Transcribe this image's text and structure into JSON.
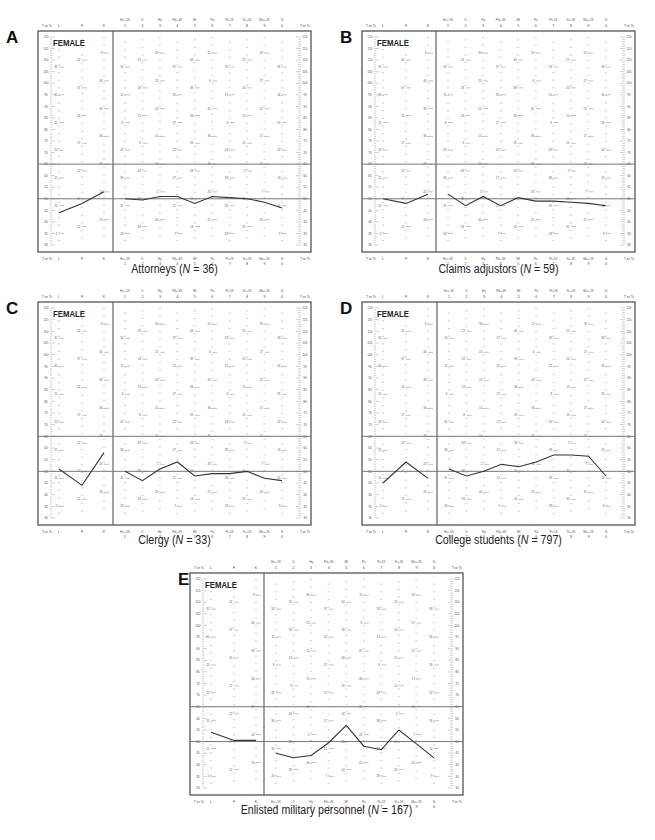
{
  "figure": {
    "y_axis_label": "T or Tc",
    "y_ticks": [
      120,
      115,
      110,
      105,
      100,
      95,
      90,
      85,
      80,
      75,
      70,
      65,
      60,
      55,
      50,
      45,
      40,
      35,
      30
    ],
    "reference_lines": [
      65,
      50
    ],
    "validity_scales": [
      "L",
      "F",
      "K"
    ],
    "clinical_scales": [
      {
        "top": "Hs+.5K",
        "num": "1"
      },
      {
        "top": "D",
        "num": "2"
      },
      {
        "top": "Hy",
        "num": "3"
      },
      {
        "top": "Pd+.4K",
        "num": "4"
      },
      {
        "top": "Mf",
        "num": "5"
      },
      {
        "top": "Pa",
        "num": "6"
      },
      {
        "top": "Pt+1K",
        "num": "7"
      },
      {
        "top": "Sc+1K",
        "num": "8"
      },
      {
        "top": "Ma+.2K",
        "num": "9"
      },
      {
        "top": "Si",
        "num": "0"
      }
    ],
    "gender_label": "FEMALE"
  },
  "panels": [
    {
      "letter": "A",
      "group": "Attorneys",
      "n_label": "N",
      "n_eq": " = 36",
      "n": 36
    },
    {
      "letter": "B",
      "group": "Claims adjustors",
      "n_label": "N",
      "n_eq": " = 59",
      "n": 59
    },
    {
      "letter": "C",
      "group": "Clergy",
      "n_label": "N",
      "n_eq": " = 33",
      "n": 33
    },
    {
      "letter": "D",
      "group": "College students",
      "n_label": "N",
      "n_eq": " = 797",
      "n": 797
    },
    {
      "letter": "E",
      "group": "Enlisted military personnel",
      "n_label": "N",
      "n_eq": " = 167",
      "n": 167
    }
  ],
  "chart_data": [
    {
      "type": "line",
      "title": "Attorneys (N = 36)",
      "subtitle": "FEMALE",
      "xlabel": "",
      "ylabel": "T or Tc",
      "ylim": [
        30,
        120
      ],
      "grid": false,
      "reference_lines": [
        65,
        50
      ],
      "categories": [
        "L",
        "F",
        "K",
        "1 Hs+.5K",
        "2 D",
        "3 Hy",
        "4 Pd+.4K",
        "5 Mf",
        "6 Pa",
        "7 Pt+1K",
        "8 Sc+1K",
        "9 Ma+.2K",
        "0 Si"
      ],
      "series": [
        {
          "name": "Validity",
          "categories": [
            "L",
            "F",
            "K"
          ],
          "values": [
            44,
            48,
            53
          ]
        },
        {
          "name": "Clinical",
          "categories": [
            "1",
            "2",
            "3",
            "4",
            "5",
            "6",
            "7",
            "8",
            "9",
            "0"
          ],
          "values": [
            50,
            49.5,
            51,
            51,
            48,
            51,
            50.5,
            50,
            48.5,
            46
          ]
        }
      ]
    },
    {
      "type": "line",
      "title": "Claims adjustors (N = 59)",
      "subtitle": "FEMALE",
      "xlabel": "",
      "ylabel": "T or Tc",
      "ylim": [
        30,
        120
      ],
      "grid": false,
      "reference_lines": [
        65,
        50
      ],
      "categories": [
        "L",
        "F",
        "K",
        "1 Hs+.5K",
        "2 D",
        "3 Hy",
        "4 Pd+.4K",
        "5 Mf",
        "6 Pa",
        "7 Pt+1K",
        "8 Sc+1K",
        "9 Ma+.2K",
        "0 Si"
      ],
      "series": [
        {
          "name": "Validity",
          "categories": [
            "L",
            "F",
            "K"
          ],
          "values": [
            50,
            48,
            52
          ]
        },
        {
          "name": "Clinical",
          "categories": [
            "1",
            "2",
            "3",
            "4",
            "5",
            "6",
            "7",
            "8",
            "9",
            "0"
          ],
          "values": [
            52,
            47,
            51,
            47,
            50.5,
            49,
            49,
            48.5,
            48,
            47
          ]
        }
      ]
    },
    {
      "type": "line",
      "title": "Clergy (N = 33)",
      "subtitle": "FEMALE",
      "xlabel": "",
      "ylabel": "T or Tc",
      "ylim": [
        30,
        120
      ],
      "grid": false,
      "reference_lines": [
        65,
        50
      ],
      "categories": [
        "L",
        "F",
        "K",
        "1 Hs+.5K",
        "2 D",
        "3 Hy",
        "4 Pd+.4K",
        "5 Mf",
        "6 Pa",
        "7 Pt+1K",
        "8 Sc+1K",
        "9 Ma+.2K",
        "0 Si"
      ],
      "series": [
        {
          "name": "Validity",
          "categories": [
            "L",
            "F",
            "K"
          ],
          "values": [
            51,
            44,
            58
          ]
        },
        {
          "name": "Clinical",
          "categories": [
            "1",
            "2",
            "3",
            "4",
            "5",
            "6",
            "7",
            "8",
            "9",
            "0"
          ],
          "values": [
            50,
            46,
            51,
            54,
            48,
            49,
            49,
            50,
            47,
            46
          ]
        }
      ]
    },
    {
      "type": "line",
      "title": "College students (N = 797)",
      "subtitle": "FEMALE",
      "xlabel": "",
      "ylabel": "T or Tc",
      "ylim": [
        30,
        120
      ],
      "grid": false,
      "reference_lines": [
        65,
        50
      ],
      "categories": [
        "L",
        "F",
        "K",
        "1 Hs+.5K",
        "2 D",
        "3 Hy",
        "4 Pd+.4K",
        "5 Mf",
        "6 Pa",
        "7 Pt+1K",
        "8 Sc+1K",
        "9 Ma+.2K",
        "0 Si"
      ],
      "series": [
        {
          "name": "Validity",
          "categories": [
            "L",
            "F",
            "K"
          ],
          "values": [
            45,
            54,
            47
          ]
        },
        {
          "name": "Clinical",
          "categories": [
            "1",
            "2",
            "3",
            "4",
            "5",
            "6",
            "7",
            "8",
            "9",
            "0"
          ],
          "values": [
            51,
            48,
            50,
            53,
            52,
            54,
            57,
            57,
            56.5,
            48
          ]
        }
      ]
    },
    {
      "type": "line",
      "title": "Enlisted military personnel (N = 167)",
      "subtitle": "FEMALE",
      "xlabel": "",
      "ylabel": "T or Tc",
      "ylim": [
        30,
        120
      ],
      "grid": false,
      "reference_lines": [
        65,
        50
      ],
      "categories": [
        "L",
        "F",
        "K",
        "1 Hs+.5K",
        "2 D",
        "3 Hy",
        "4 Pd+.4K",
        "5 Mf",
        "6 Pa",
        "7 Pt+1K",
        "8 Sc+1K",
        "9 Ma+.2K",
        "0 Si"
      ],
      "series": [
        {
          "name": "Validity",
          "categories": [
            "L",
            "F",
            "K"
          ],
          "values": [
            54,
            50.5,
            50.5
          ]
        },
        {
          "name": "Clinical",
          "categories": [
            "1",
            "2",
            "3",
            "4",
            "5",
            "6",
            "7",
            "8",
            "9",
            "0"
          ],
          "values": [
            45,
            43,
            44,
            49.5,
            57,
            48,
            46.5,
            55,
            49,
            43
          ]
        }
      ]
    }
  ]
}
